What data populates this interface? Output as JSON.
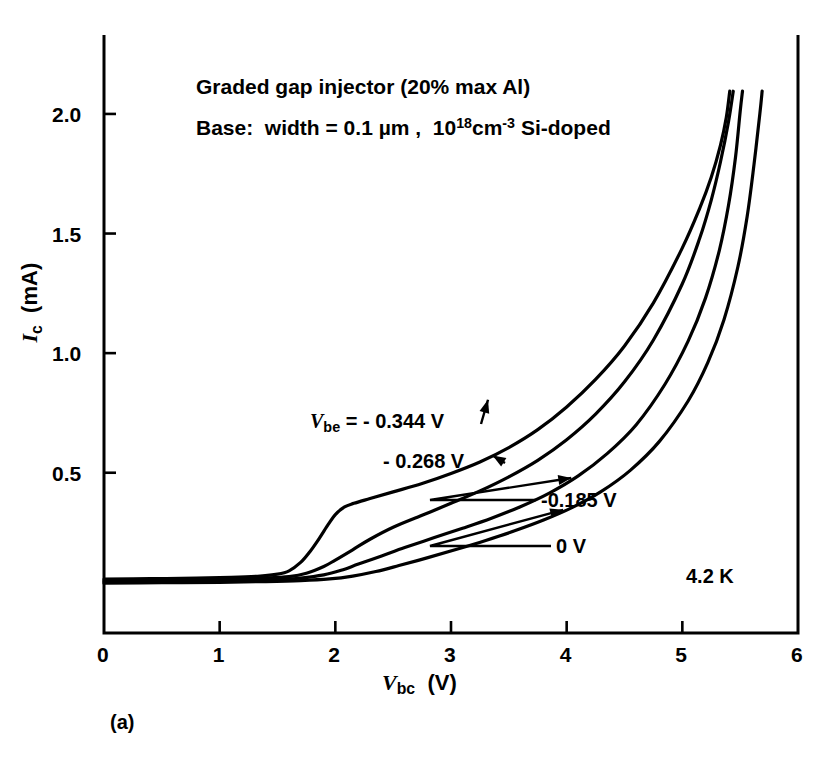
{
  "figure": {
    "caption": "(a)",
    "temperature_label": "4.2 K",
    "annotations": [
      "Graded gap injector (20% max Al)",
      "Base:  width = 0.1 µm ,  10^18 cm^-3 Si-doped"
    ],
    "annotation_parts": {
      "line1": "Graded gap injector (20% max Al)",
      "line2_a": "Base:  width = 0.1 µm ,  10",
      "line2_exp": "18",
      "line2_b": "cm",
      "line2_exp2": "-3",
      "line2_c": " Si-doped"
    }
  },
  "chart_data": {
    "type": "line",
    "title": "",
    "xlabel": "V_bc (V)",
    "ylabel": "I_c (mA)",
    "xlabel_parts": {
      "symbol": "V",
      "subscript": "bc",
      "unit": "(V)"
    },
    "ylabel_parts": {
      "symbol": "I",
      "subscript": "c",
      "unit": "(mA)"
    },
    "xlim": [
      0,
      6
    ],
    "ylim": [
      -0.17,
      2.33
    ],
    "xticks": [
      0,
      1,
      2,
      3,
      4,
      5,
      6
    ],
    "xtick_labels": [
      "0",
      "1",
      "2",
      "3",
      "4",
      "5",
      "6"
    ],
    "yticks": [
      0.5,
      1.0,
      1.5,
      2.0
    ],
    "ytick_labels": [
      "0.5",
      "1.0",
      "1.5",
      "2.0"
    ],
    "grid": false,
    "legend": "inline-annotations",
    "line_color": "#000000",
    "line_width": 3.2,
    "series": [
      {
        "name": "-0.344 V",
        "label": "V_be = - 0.344 V",
        "points": [
          [
            0.0,
            0.055
          ],
          [
            0.4,
            0.057
          ],
          [
            0.8,
            0.06
          ],
          [
            1.1,
            0.063
          ],
          [
            1.35,
            0.068
          ],
          [
            1.5,
            0.076
          ],
          [
            1.6,
            0.09
          ],
          [
            1.7,
            0.125
          ],
          [
            1.78,
            0.17
          ],
          [
            1.86,
            0.225
          ],
          [
            1.94,
            0.285
          ],
          [
            2.0,
            0.325
          ],
          [
            2.08,
            0.357
          ],
          [
            2.16,
            0.372
          ],
          [
            2.3,
            0.392
          ],
          [
            2.5,
            0.42
          ],
          [
            2.75,
            0.455
          ],
          [
            3.0,
            0.497
          ],
          [
            3.25,
            0.545
          ],
          [
            3.5,
            0.605
          ],
          [
            3.75,
            0.68
          ],
          [
            4.0,
            0.775
          ],
          [
            4.25,
            0.89
          ],
          [
            4.5,
            1.03
          ],
          [
            4.75,
            1.21
          ],
          [
            5.0,
            1.44
          ],
          [
            5.15,
            1.605
          ],
          [
            5.25,
            1.735
          ],
          [
            5.33,
            1.87
          ],
          [
            5.38,
            1.985
          ],
          [
            5.41,
            2.095
          ]
        ]
      },
      {
        "name": "-0.268 V",
        "label": "- 0.268 V",
        "points": [
          [
            0.0,
            0.048
          ],
          [
            0.4,
            0.05
          ],
          [
            0.8,
            0.053
          ],
          [
            1.1,
            0.056
          ],
          [
            1.4,
            0.06
          ],
          [
            1.6,
            0.066
          ],
          [
            1.75,
            0.08
          ],
          [
            1.9,
            0.108
          ],
          [
            2.0,
            0.135
          ],
          [
            2.15,
            0.178
          ],
          [
            2.3,
            0.222
          ],
          [
            2.5,
            0.272
          ],
          [
            2.75,
            0.322
          ],
          [
            3.0,
            0.372
          ],
          [
            3.25,
            0.424
          ],
          [
            3.5,
            0.483
          ],
          [
            3.75,
            0.552
          ],
          [
            4.0,
            0.638
          ],
          [
            4.25,
            0.745
          ],
          [
            4.5,
            0.88
          ],
          [
            4.75,
            1.055
          ],
          [
            5.0,
            1.29
          ],
          [
            5.15,
            1.48
          ],
          [
            5.25,
            1.64
          ],
          [
            5.33,
            1.8
          ],
          [
            5.4,
            1.97
          ],
          [
            5.44,
            2.095
          ]
        ]
      },
      {
        "name": "-0.185 V",
        "label": "-0.185 V",
        "points": [
          [
            0.0,
            0.043
          ],
          [
            0.4,
            0.045
          ],
          [
            0.8,
            0.047
          ],
          [
            1.2,
            0.05
          ],
          [
            1.5,
            0.054
          ],
          [
            1.7,
            0.06
          ],
          [
            1.9,
            0.073
          ],
          [
            2.05,
            0.092
          ],
          [
            2.2,
            0.118
          ],
          [
            2.4,
            0.152
          ],
          [
            2.6,
            0.187
          ],
          [
            2.85,
            0.228
          ],
          [
            3.1,
            0.268
          ],
          [
            3.35,
            0.31
          ],
          [
            3.6,
            0.358
          ],
          [
            3.85,
            0.415
          ],
          [
            4.1,
            0.487
          ],
          [
            4.35,
            0.58
          ],
          [
            4.6,
            0.7
          ],
          [
            4.85,
            0.87
          ],
          [
            5.05,
            1.05
          ],
          [
            5.2,
            1.23
          ],
          [
            5.32,
            1.43
          ],
          [
            5.4,
            1.62
          ],
          [
            5.46,
            1.82
          ],
          [
            5.5,
            2.01
          ],
          [
            5.52,
            2.095
          ]
        ]
      },
      {
        "name": "0 V",
        "label": "0 V",
        "points": [
          [
            0.0,
            0.038
          ],
          [
            0.5,
            0.04
          ],
          [
            1.0,
            0.042
          ],
          [
            1.4,
            0.045
          ],
          [
            1.7,
            0.049
          ],
          [
            1.95,
            0.056
          ],
          [
            2.15,
            0.068
          ],
          [
            2.35,
            0.087
          ],
          [
            2.55,
            0.112
          ],
          [
            2.8,
            0.145
          ],
          [
            3.05,
            0.18
          ],
          [
            3.3,
            0.217
          ],
          [
            3.55,
            0.257
          ],
          [
            3.8,
            0.302
          ],
          [
            4.05,
            0.355
          ],
          [
            4.3,
            0.422
          ],
          [
            4.55,
            0.51
          ],
          [
            4.8,
            0.63
          ],
          [
            5.05,
            0.8
          ],
          [
            5.22,
            0.96
          ],
          [
            5.36,
            1.14
          ],
          [
            5.48,
            1.36
          ],
          [
            5.56,
            1.57
          ],
          [
            5.62,
            1.79
          ],
          [
            5.67,
            2.0
          ],
          [
            5.69,
            2.095
          ]
        ]
      }
    ],
    "callouts": [
      {
        "label_key": 0,
        "text": "V_be = - 0.344 V",
        "target": [
          3.32,
          0.805
        ]
      },
      {
        "label_key": 1,
        "text": "- 0.268 V",
        "target": [
          3.36,
          0.572
        ]
      },
      {
        "label_key": 2,
        "text": "-0.185 V",
        "target": [
          4.04,
          0.478
        ]
      },
      {
        "label_key": 3,
        "text": "0 V",
        "target": [
          3.97,
          0.345
        ]
      }
    ]
  }
}
